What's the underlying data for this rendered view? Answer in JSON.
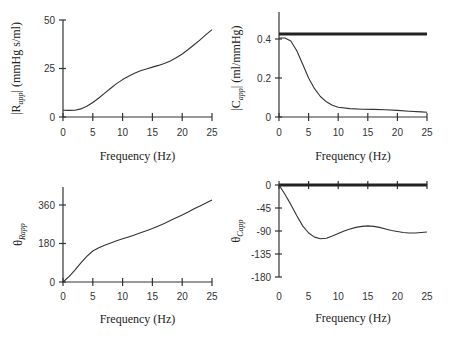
{
  "chart_data": [
    {
      "id": "r_mag",
      "type": "line",
      "title": "",
      "xlabel": "Frequency  (Hz)",
      "ylabel": "|R_app|  (mmHg s/ml)",
      "ylabel_main": "|R",
      "ylabel_sub": "app",
      "ylabel_rest": "|  (mmHg s/ml)",
      "xlim": [
        0,
        25
      ],
      "ylim": [
        0,
        50
      ],
      "xticks": [
        0,
        5,
        10,
        15,
        20,
        25
      ],
      "yticks": [
        0,
        25,
        50
      ],
      "grid": false,
      "series": [
        {
          "name": "|R_app|",
          "x": [
            0,
            1,
            2,
            3,
            4,
            5,
            6,
            7,
            8,
            9,
            10,
            11,
            12,
            13,
            14,
            15,
            16,
            17,
            18,
            19,
            20,
            21,
            22,
            23,
            24,
            25
          ],
          "values": [
            3.5,
            3.4,
            3.5,
            4.2,
            5.5,
            7.5,
            9.8,
            12.3,
            14.8,
            17.2,
            19.3,
            21.0,
            22.5,
            23.8,
            24.8,
            25.7,
            26.6,
            27.6,
            28.9,
            30.5,
            32.5,
            34.8,
            37.2,
            39.8,
            42.4,
            45.0
          ]
        }
      ]
    },
    {
      "id": "c_mag",
      "type": "line",
      "title": "",
      "xlabel": "Frequency  (Hz)",
      "ylabel": "|C_app|  (ml/mmHg)",
      "ylabel_main": "|C",
      "ylabel_sub": "app",
      "ylabel_rest": "|  (ml/mmHg)",
      "xlim": [
        0,
        25
      ],
      "ylim": [
        0,
        0.5
      ],
      "xticks": [
        0,
        5,
        10,
        15,
        20,
        25
      ],
      "yticks": [
        0,
        0.2,
        0.4
      ],
      "grid": false,
      "series": [
        {
          "name": "reference (thick)",
          "x": [
            0,
            25
          ],
          "values": [
            0.425,
            0.425
          ]
        },
        {
          "name": "|C_app|",
          "x": [
            0,
            1,
            2,
            3,
            4,
            5,
            6,
            7,
            8,
            9,
            10,
            12,
            14,
            16,
            18,
            20,
            22,
            24,
            25
          ],
          "values": [
            0.405,
            0.405,
            0.39,
            0.34,
            0.27,
            0.2,
            0.145,
            0.105,
            0.078,
            0.06,
            0.05,
            0.043,
            0.04,
            0.039,
            0.037,
            0.034,
            0.03,
            0.026,
            0.024
          ]
        }
      ]
    },
    {
      "id": "r_phase",
      "type": "line",
      "title": "",
      "xlabel": "Frequency  (Hz)",
      "ylabel": "θ_Rapp",
      "ylabel_main": "θ",
      "ylabel_sub": "Rapp",
      "ylabel_rest": "",
      "xlim": [
        0,
        25
      ],
      "ylim": [
        0,
        450
      ],
      "xticks": [
        0,
        5,
        10,
        15,
        20,
        25
      ],
      "yticks": [
        0,
        180,
        360
      ],
      "grid": false,
      "series": [
        {
          "name": "θ_Rapp",
          "x": [
            0,
            1,
            2,
            3,
            4,
            5,
            6,
            7,
            8,
            9,
            10,
            11,
            12,
            13,
            14,
            15,
            16,
            17,
            18,
            19,
            20,
            21,
            22,
            23,
            24,
            25
          ],
          "values": [
            0,
            25,
            55,
            90,
            120,
            145,
            160,
            172,
            183,
            193,
            202,
            211,
            220,
            230,
            240,
            250,
            262,
            274,
            287,
            300,
            313,
            327,
            342,
            356,
            370,
            383
          ]
        }
      ]
    },
    {
      "id": "c_phase",
      "type": "line",
      "title": "",
      "xlabel": "Frequency (Hz)",
      "ylabel": "θ_Capp",
      "ylabel_main": "θ",
      "ylabel_sub": "Capp",
      "ylabel_rest": "",
      "xlim": [
        0,
        25
      ],
      "ylim": [
        -180,
        0
      ],
      "xticks": [
        0,
        5,
        10,
        15,
        20,
        25
      ],
      "yticks": [
        0,
        -45,
        -90,
        -135,
        -180
      ],
      "grid": false,
      "series": [
        {
          "name": "reference (thick)",
          "x": [
            0,
            25
          ],
          "values": [
            0,
            0
          ]
        },
        {
          "name": "θ_Capp",
          "x": [
            0,
            1,
            2,
            3,
            4,
            5,
            6,
            7,
            8,
            9,
            10,
            11,
            12,
            13,
            14,
            15,
            16,
            17,
            18,
            19,
            20,
            21,
            22,
            23,
            24,
            25
          ],
          "values": [
            0,
            -18,
            -38,
            -60,
            -80,
            -94,
            -102,
            -105,
            -104,
            -100,
            -95,
            -90,
            -86,
            -83,
            -81,
            -80,
            -81,
            -83,
            -86,
            -89,
            -91,
            -93,
            -94,
            -94,
            -93,
            -92
          ]
        }
      ]
    }
  ]
}
